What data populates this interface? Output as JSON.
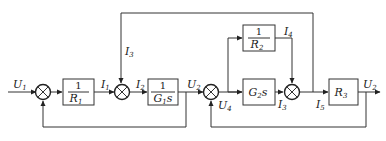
{
  "diagram": {
    "type": "block-diagram",
    "signals": {
      "U1": {
        "base": "U",
        "sub": "1"
      },
      "U2": {
        "base": "U",
        "sub": "2"
      },
      "U3": {
        "base": "U",
        "sub": "2"
      },
      "U4": {
        "base": "U",
        "sub": "4"
      },
      "I1": {
        "base": "I",
        "sub": "1"
      },
      "I2": {
        "base": "I",
        "sub": "2"
      },
      "I3": {
        "base": "I",
        "sub": "3"
      },
      "I3b": {
        "base": "I",
        "sub": "3"
      },
      "I4": {
        "base": "I",
        "sub": "4"
      },
      "I5": {
        "base": "I",
        "sub": "5"
      }
    },
    "blocks": {
      "b1": {
        "num": "1",
        "den": "R",
        "den_sub": "1"
      },
      "b2": {
        "num": "1",
        "den": "G",
        "den_sub": "1",
        "den_suffix": "s"
      },
      "b3": {
        "num": "1",
        "den": "R",
        "den_sub": "2"
      },
      "b4": {
        "main": "G",
        "sub": "2",
        "suffix": "s"
      },
      "b5": {
        "main": "R",
        "sub": "3"
      }
    },
    "summing_junctions": [
      {
        "id": "sj1",
        "signs": [
          "+",
          "-"
        ]
      },
      {
        "id": "sj2",
        "signs": [
          "+",
          "-"
        ]
      },
      {
        "id": "sj3",
        "signs": [
          "+",
          "-"
        ]
      },
      {
        "id": "sj4",
        "signs": [
          "+",
          "+"
        ]
      }
    ]
  }
}
